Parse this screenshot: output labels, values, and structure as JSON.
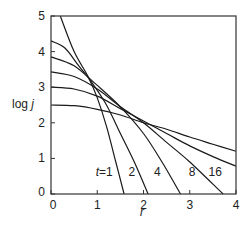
{
  "chart_data": {
    "type": "line",
    "title": "",
    "xlabel": "r",
    "ylabel": "log j",
    "xlim": [
      0,
      4
    ],
    "ylim": [
      0,
      5
    ],
    "xticks": [
      0,
      1,
      2,
      3,
      4
    ],
    "yticks": [
      0,
      1,
      2,
      3,
      4,
      5
    ],
    "grid": false,
    "legend": "inline curve labels near x-axis",
    "series": [
      {
        "name": "t=1",
        "label": "t=1",
        "points": [
          [
            0.2,
            5.0
          ],
          [
            0.5,
            4.0
          ],
          [
            0.8,
            3.3
          ],
          [
            1.0,
            2.7
          ],
          [
            1.2,
            1.9
          ],
          [
            1.4,
            0.9
          ],
          [
            1.58,
            0.0
          ]
        ]
      },
      {
        "name": "t=2",
        "label": "2",
        "points": [
          [
            0.0,
            4.3
          ],
          [
            0.3,
            4.1
          ],
          [
            0.6,
            3.6
          ],
          [
            0.9,
            3.1
          ],
          [
            1.2,
            2.5
          ],
          [
            1.5,
            1.7
          ],
          [
            1.8,
            0.9
          ],
          [
            2.1,
            0.0
          ]
        ]
      },
      {
        "name": "t=4",
        "label": "4",
        "points": [
          [
            0.0,
            3.85
          ],
          [
            0.5,
            3.6
          ],
          [
            1.0,
            3.05
          ],
          [
            1.5,
            2.45
          ],
          [
            2.0,
            1.7
          ],
          [
            2.4,
            0.9
          ],
          [
            2.8,
            0.0
          ]
        ]
      },
      {
        "name": "t=8",
        "label": "8",
        "points": [
          [
            0.0,
            3.43
          ],
          [
            0.5,
            3.3
          ],
          [
            1.0,
            2.95
          ],
          [
            1.5,
            2.45
          ],
          [
            2.0,
            2.0
          ],
          [
            2.5,
            1.45
          ],
          [
            3.0,
            0.9
          ],
          [
            3.72,
            0.0
          ]
        ]
      },
      {
        "name": "t=16",
        "label": "16",
        "points": [
          [
            0.0,
            3.0
          ],
          [
            0.5,
            2.95
          ],
          [
            1.0,
            2.75
          ],
          [
            1.5,
            2.4
          ],
          [
            2.0,
            2.05
          ],
          [
            2.5,
            1.7
          ],
          [
            3.0,
            1.35
          ],
          [
            3.5,
            1.05
          ],
          [
            4.0,
            0.78
          ]
        ]
      },
      {
        "name": "unlabeled",
        "label": "",
        "points": [
          [
            0.0,
            2.5
          ],
          [
            0.5,
            2.48
          ],
          [
            1.0,
            2.38
          ],
          [
            1.5,
            2.22
          ],
          [
            2.0,
            2.0
          ],
          [
            2.5,
            1.82
          ],
          [
            3.0,
            1.6
          ],
          [
            3.5,
            1.4
          ],
          [
            4.0,
            1.2
          ]
        ]
      }
    ],
    "annotations": [
      {
        "text": "t=1",
        "r": 1.15,
        "logj": 0.5
      },
      {
        "text": "2",
        "r": 1.75,
        "logj": 0.5
      },
      {
        "text": "4",
        "r": 2.3,
        "logj": 0.5
      },
      {
        "text": "8",
        "r": 3.05,
        "logj": 0.5
      },
      {
        "text": "16",
        "r": 3.55,
        "logj": 0.5
      }
    ]
  },
  "axes": {
    "x_label": "r",
    "y_label_prefix": "log ",
    "y_label_var": "j"
  }
}
